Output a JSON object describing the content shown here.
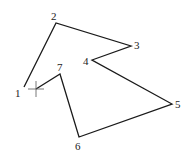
{
  "diagram": {
    "type": "polygon-path",
    "stroke_color": "#1a1a1a",
    "vertices": [
      {
        "id": "1",
        "label": "1",
        "x": 24,
        "y": 87,
        "lx": 15,
        "ly": 97
      },
      {
        "id": "2",
        "label": "2",
        "x": 56,
        "y": 23,
        "lx": 51,
        "ly": 20
      },
      {
        "id": "3",
        "label": "3",
        "x": 131,
        "y": 46,
        "lx": 134,
        "ly": 49
      },
      {
        "id": "4",
        "label": "4",
        "x": 92,
        "y": 60,
        "lx": 83,
        "ly": 65
      },
      {
        "id": "5",
        "label": "5",
        "x": 172,
        "y": 104,
        "lx": 175,
        "ly": 108
      },
      {
        "id": "6",
        "label": "6",
        "x": 79,
        "y": 137,
        "lx": 75,
        "ly": 150
      },
      {
        "id": "7",
        "label": "7",
        "x": 60,
        "y": 74,
        "lx": 57,
        "ly": 71
      }
    ],
    "cursor": {
      "name": "crosshair",
      "x": 36,
      "y": 89
    }
  }
}
